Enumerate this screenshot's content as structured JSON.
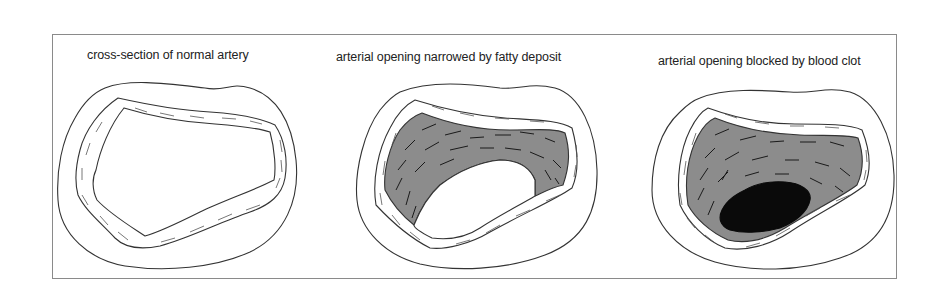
{
  "panels": [
    {
      "id": "normal",
      "caption": "cross-section of normal artery",
      "state": "open lumen"
    },
    {
      "id": "narrowed",
      "caption": "arterial opening narrowed by fatty deposit",
      "state": "plaque narrowing"
    },
    {
      "id": "blocked",
      "caption": "arterial opening blocked by blood clot",
      "state": "clot occlusion"
    }
  ],
  "colors": {
    "outline": "#333333",
    "frame": "#8a8a8a",
    "plaque": "#8c8c8c",
    "clot": "#0a0a0a",
    "background": "#ffffff"
  }
}
